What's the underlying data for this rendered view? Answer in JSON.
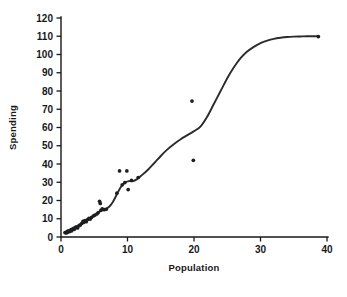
{
  "chart_data": {
    "type": "scatter",
    "title": "",
    "subtitle": "",
    "xlabel": "Population",
    "ylabel": "Spending",
    "xlim": [
      0,
      40
    ],
    "ylim": [
      0,
      120
    ],
    "xticks": [
      0,
      10,
      20,
      30,
      40
    ],
    "yticks": [
      0,
      10,
      20,
      30,
      40,
      50,
      60,
      70,
      80,
      90,
      100,
      110,
      120
    ],
    "xtick_labels": [
      "0",
      "10",
      "20",
      "30",
      "40"
    ],
    "ytick_labels": [
      "0",
      "10",
      "20",
      "30",
      "40",
      "50",
      "60",
      "70",
      "80",
      "90",
      "100",
      "110",
      "120"
    ],
    "grid": false,
    "legend": null,
    "annotations": [],
    "marker_color": "#1d1e20",
    "curve_color": "#2a2b2e",
    "axis_color": "#17181a",
    "background_color": "#ffffff",
    "series": [
      {
        "name": "observations",
        "type": "scatter",
        "points": [
          [
            0.6,
            2.4
          ],
          [
            0.8,
            2.2
          ],
          [
            0.9,
            3.0
          ],
          [
            1.0,
            2.6
          ],
          [
            1.1,
            3.4
          ],
          [
            1.3,
            3.0
          ],
          [
            1.5,
            4.0
          ],
          [
            1.6,
            3.4
          ],
          [
            1.8,
            4.6
          ],
          [
            2.0,
            4.2
          ],
          [
            2.1,
            5.2
          ],
          [
            2.3,
            5.6
          ],
          [
            2.5,
            5.0
          ],
          [
            2.7,
            6.2
          ],
          [
            2.9,
            6.6
          ],
          [
            3.1,
            7.4
          ],
          [
            3.3,
            8.6
          ],
          [
            3.4,
            8.0
          ],
          [
            3.6,
            9.0
          ],
          [
            3.8,
            8.4
          ],
          [
            4.0,
            9.6
          ],
          [
            4.2,
            10.2
          ],
          [
            4.4,
            9.8
          ],
          [
            4.6,
            10.8
          ],
          [
            4.9,
            11.6
          ],
          [
            5.1,
            12.0
          ],
          [
            5.4,
            12.6
          ],
          [
            5.6,
            13.4
          ],
          [
            5.8,
            19.6
          ],
          [
            5.9,
            18.4
          ],
          [
            6.0,
            14.6
          ],
          [
            6.2,
            15.4
          ],
          [
            6.5,
            15.0
          ],
          [
            6.8,
            15.2
          ],
          [
            8.4,
            24.0
          ],
          [
            8.8,
            36.2
          ],
          [
            9.2,
            28.6
          ],
          [
            9.6,
            29.8
          ],
          [
            9.9,
            36.2
          ],
          [
            10.1,
            26.0
          ],
          [
            10.6,
            31.0
          ],
          [
            11.6,
            32.6
          ],
          [
            19.7,
            74.5
          ],
          [
            19.9,
            42.0
          ],
          [
            38.7,
            109.8
          ]
        ]
      },
      {
        "name": "smoothed fit",
        "type": "line",
        "points": [
          [
            0.6,
            2.6
          ],
          [
            1.2,
            3.2
          ],
          [
            1.8,
            4.2
          ],
          [
            2.4,
            5.4
          ],
          [
            3.0,
            7.0
          ],
          [
            3.6,
            8.6
          ],
          [
            4.2,
            10.0
          ],
          [
            4.8,
            11.4
          ],
          [
            5.4,
            12.8
          ],
          [
            6.0,
            14.4
          ],
          [
            6.6,
            15.2
          ],
          [
            7.2,
            16.4
          ],
          [
            7.8,
            19.2
          ],
          [
            8.4,
            23.4
          ],
          [
            9.0,
            27.4
          ],
          [
            9.6,
            29.8
          ],
          [
            10.2,
            30.6
          ],
          [
            10.8,
            30.6
          ],
          [
            11.4,
            31.6
          ],
          [
            12.0,
            33.4
          ],
          [
            13.0,
            36.6
          ],
          [
            14.0,
            40.4
          ],
          [
            15.0,
            44.4
          ],
          [
            16.0,
            48.0
          ],
          [
            17.0,
            51.0
          ],
          [
            18.0,
            53.6
          ],
          [
            19.0,
            55.8
          ],
          [
            20.0,
            58.0
          ],
          [
            21.0,
            60.6
          ],
          [
            22.0,
            66.0
          ],
          [
            23.0,
            73.0
          ],
          [
            24.0,
            80.0
          ],
          [
            25.0,
            87.0
          ],
          [
            26.0,
            93.0
          ],
          [
            27.0,
            98.0
          ],
          [
            28.0,
            101.6
          ],
          [
            29.0,
            104.2
          ],
          [
            30.0,
            106.2
          ],
          [
            31.0,
            107.6
          ],
          [
            32.0,
            108.6
          ],
          [
            33.0,
            109.2
          ],
          [
            34.0,
            109.6
          ],
          [
            35.0,
            109.8
          ],
          [
            36.0,
            109.9
          ],
          [
            37.0,
            110.0
          ],
          [
            38.0,
            110.0
          ],
          [
            38.7,
            110.0
          ]
        ]
      }
    ]
  }
}
